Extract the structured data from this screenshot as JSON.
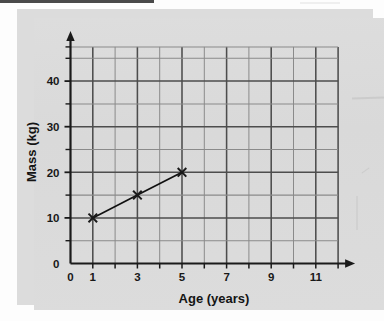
{
  "chart_data": {
    "type": "line",
    "title": "",
    "xlabel": "Age (years)",
    "ylabel": "Mass (kg)",
    "xlim": [
      0,
      12
    ],
    "ylim": [
      0,
      47.5
    ],
    "grid": true,
    "legend": "none",
    "x_tick_labels": [
      "0",
      "1",
      "3",
      "5",
      "7",
      "9",
      "11"
    ],
    "x_tick_values": [
      0,
      1,
      3,
      5,
      7,
      9,
      11
    ],
    "x_minor_ticks": [
      1,
      2,
      3,
      4,
      5,
      6,
      7,
      8,
      9,
      10,
      11,
      12
    ],
    "y_tick_labels": [
      "0",
      "10",
      "20",
      "30",
      "40"
    ],
    "y_tick_values": [
      0,
      10,
      20,
      30,
      40
    ],
    "y_minor_ticks": [
      5,
      10,
      15,
      20,
      25,
      30,
      35,
      40,
      45,
      47.5
    ],
    "marker": "x",
    "series": [
      {
        "name": "mass-vs-age",
        "points": [
          {
            "x": 1,
            "y": 10
          },
          {
            "x": 3,
            "y": 15
          },
          {
            "x": 5,
            "y": 20
          }
        ]
      }
    ],
    "colors": {
      "ink": "#1a1a1a",
      "grid_major": "#4d4d4d",
      "grid_minor": "#8a8a8a",
      "paper": "#dcdcdc"
    }
  },
  "labels": {
    "x_axis_title": "Age (years)",
    "y_axis_title": "Mass (kg)",
    "y_origin_label": "0"
  }
}
